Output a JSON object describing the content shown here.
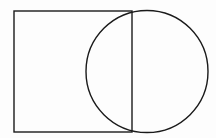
{
  "diagram": {
    "width": 216,
    "height": 138,
    "background": "#fdfdfd",
    "stroke_color": "#1a1a1a",
    "stroke_width": 1.4,
    "shapes": [
      {
        "type": "rect",
        "name": "square",
        "x": 14,
        "y": 11,
        "width": 118,
        "height": 121
      },
      {
        "type": "circle",
        "name": "circle",
        "cx": 147,
        "cy": 71.5,
        "r": 61
      }
    ]
  }
}
